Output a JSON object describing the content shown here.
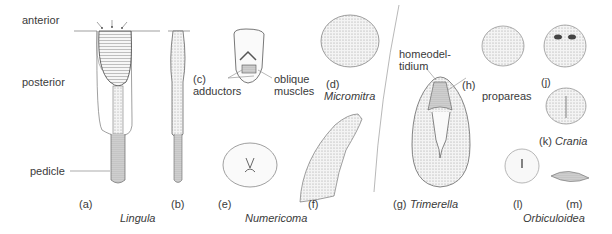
{
  "labels": {
    "anterior": "anterior",
    "posterior": "posterior",
    "pedicle": "pedicle",
    "a": "(a)",
    "b": "(b)",
    "lingula": "Lingula",
    "c": "(c)",
    "adductors": "adductors",
    "oblique1": "oblique",
    "oblique2": "muscles",
    "d": "(d)",
    "micromitra": "Micromitra",
    "e": "(e)",
    "f": "(f)",
    "numericoma": "Numericoma",
    "homeodel1": "homeodel-",
    "homeodel2": "tidium",
    "h": "(h)",
    "propareas": "propareas",
    "g": "(g)",
    "trimerella": "Trimerella",
    "j": "(j)",
    "k": "(k)",
    "crania": "Crania",
    "l": "(l)",
    "m": "(m)",
    "orbiculoidea": "Orbiculoidea"
  },
  "colors": {
    "ink": "#555555",
    "shade": "#bdbdbd",
    "text": "#3a3a3a"
  }
}
